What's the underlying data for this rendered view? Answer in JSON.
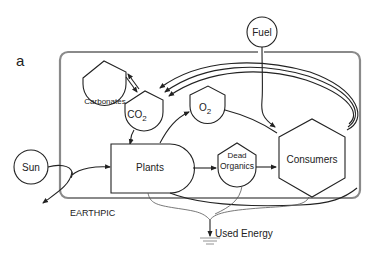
{
  "figure": {
    "panel_label": "a",
    "boundary_label": "EARTHPIC",
    "nodes": {
      "sun": "Sun",
      "fuel": "Fuel",
      "carbonates": "Carbonates",
      "co2": "CO",
      "co2_sub": "2",
      "o2": "O",
      "o2_sub": "2",
      "plants": "Plants",
      "dead_organics_1": "Dead",
      "dead_organics_2": "Organics",
      "consumers": "Consumers",
      "used_energy": "Used Energy"
    },
    "colors": {
      "boundary": "#8a8a8a",
      "stroke": "#222222",
      "heat_sink_line": "#777777"
    }
  }
}
